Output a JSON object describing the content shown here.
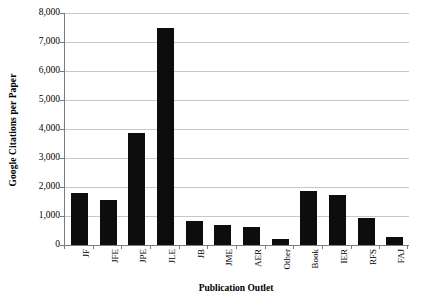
{
  "chart_data": {
    "type": "bar",
    "title": "",
    "xlabel": "Publication Outlet",
    "ylabel": "Google Citations per Paper",
    "categories": [
      "JF",
      "JFE",
      "JPE",
      "JLE",
      "JB",
      "JME",
      "AER",
      "Other",
      "Book",
      "IER",
      "RFS",
      "FAJ"
    ],
    "values": [
      1790,
      1550,
      3850,
      7500,
      830,
      700,
      630,
      210,
      1870,
      1720,
      930,
      270
    ],
    "ylim": [
      0,
      8000
    ],
    "ytick_labels": [
      "8,000",
      "7,000",
      "6,000",
      "5,000",
      "4,000",
      "3,000",
      "2,000",
      "1,000",
      "0"
    ],
    "ytick_values": [
      8000,
      7000,
      6000,
      5000,
      4000,
      3000,
      2000,
      1000,
      0
    ],
    "grid": true,
    "legend": "none",
    "bar_color": "#0d0d0d",
    "gridline_color": "#c8c8c8",
    "axis_color": "#7d7d7d",
    "background_color": "#ffffff"
  }
}
